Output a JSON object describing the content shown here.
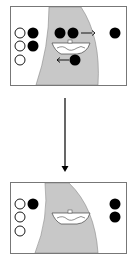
{
  "diagram": {
    "colors": {
      "river": "#c8c8c8",
      "border": "#777777",
      "filled": "#000000",
      "hollow": "#ffffff"
    },
    "states": [
      {
        "name": "before",
        "left_bank": {
          "hollow": 3,
          "filled": 2
        },
        "boat_area": {
          "filled": 2,
          "moving": "right"
        },
        "boat_return": {
          "filled": 1,
          "moving": "left"
        },
        "right_bank": {
          "filled": 1
        }
      },
      {
        "name": "after",
        "left_bank": {
          "hollow": 3,
          "filled": 1
        },
        "right_bank": {
          "filled": 2
        }
      }
    ],
    "transition_arrow": "down"
  }
}
